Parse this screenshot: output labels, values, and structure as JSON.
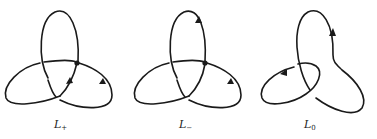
{
  "figure": {
    "stroke_color": "#1a1a1a",
    "background": "#ffffff"
  },
  "panels": [
    {
      "id": "L_plus",
      "label_main": "L",
      "label_sub": "+",
      "crossing": "positive",
      "crossing_dot": true
    },
    {
      "id": "L_minus",
      "label_main": "L",
      "label_sub": "−",
      "crossing": "negative",
      "crossing_dot": true
    },
    {
      "id": "L_zero",
      "label_main": "L",
      "label_sub": "0",
      "crossing": "smoothed",
      "crossing_dot": false
    }
  ]
}
